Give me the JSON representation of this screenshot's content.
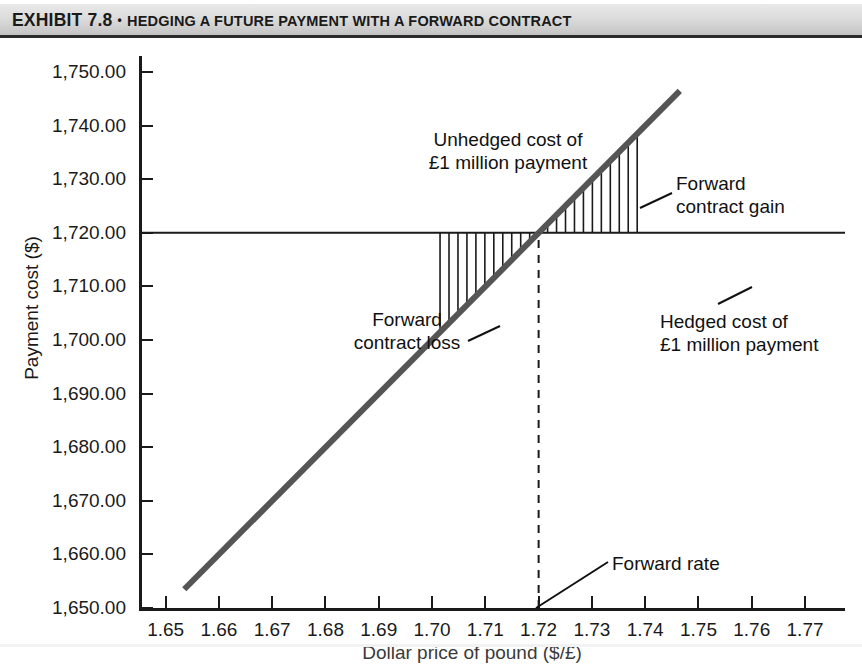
{
  "exhibit": {
    "number_label": "EXHIBIT 7.8",
    "bullet": "•",
    "title": "HEDGING A FUTURE PAYMENT WITH A FORWARD CONTRACT"
  },
  "chart_data": {
    "type": "line",
    "title": "Hedging a Future Payment with a Forward Contract",
    "xlabel": "Dollar price of pound ($/£)",
    "ylabel": "Payment cost ($)",
    "xlim": [
      1.645,
      1.7775
    ],
    "ylim": [
      1650.0,
      1753.0
    ],
    "grid": false,
    "legend": "none",
    "xticks": [
      "1.65",
      "1.66",
      "1.67",
      "1.68",
      "1.69",
      "1.70",
      "1.71",
      "1.72",
      "1.73",
      "1.74",
      "1.75",
      "1.76",
      "1.77"
    ],
    "xtick_values": [
      1.65,
      1.66,
      1.67,
      1.68,
      1.69,
      1.7,
      1.71,
      1.72,
      1.73,
      1.74,
      1.75,
      1.76,
      1.77
    ],
    "yticks": [
      "1,650.00",
      "1,660.00",
      "1,670.00",
      "1,680.00",
      "1,690.00",
      "1,700.00",
      "1,710.00",
      "1,720.00",
      "1,730.00",
      "1,740.00",
      "1,750.00"
    ],
    "ytick_values": [
      1650,
      1660,
      1670,
      1680,
      1690,
      1700,
      1710,
      1720,
      1730,
      1740,
      1750
    ],
    "series": [
      {
        "name": "Unhedged cost of £1 million payment",
        "style": "solid-thick",
        "color": "#555555",
        "x": [
          1.6535,
          1.7465
        ],
        "y": [
          1653.5,
          1746.5
        ],
        "slope": 1000,
        "note": "cost = 1,000,000 × spot rate"
      },
      {
        "name": "Hedged cost of £1 million payment",
        "style": "solid-thin-horizontal",
        "color": "#1a1a1a",
        "x": [
          1.645,
          1.7775
        ],
        "y": [
          1720.0,
          1720.0
        ],
        "constant_value": 1720.0
      },
      {
        "name": "Forward rate",
        "style": "dashed-vertical",
        "color": "#1a1a1a",
        "x_value": 1.72,
        "y_range": [
          1650.0,
          1720.0
        ]
      }
    ],
    "shaded_regions": [
      {
        "name": "Forward contract loss",
        "hatch": "vertical-lines",
        "x_range": [
          1.7015,
          1.72
        ],
        "y_upper": 1720.0,
        "y_lower_is_line": true
      },
      {
        "name": "Forward contract gain",
        "hatch": "vertical-lines",
        "x_range": [
          1.72,
          1.7385
        ],
        "y_lower": 1720.0,
        "y_upper_is_line": true
      }
    ],
    "annotations": [
      {
        "id": "unhedged",
        "lines": [
          "Unhedged cost of",
          "£1 million payment"
        ],
        "x": 1.705,
        "y": 1737
      },
      {
        "id": "gain",
        "lines": [
          "Forward",
          "contract gain"
        ],
        "x": 1.748,
        "y": 1729
      },
      {
        "id": "loss",
        "lines": [
          "Forward",
          "contract loss"
        ],
        "x": 1.69,
        "y": 1712
      },
      {
        "id": "hedged",
        "lines": [
          "Hedged cost of",
          "£1 million payment"
        ],
        "x": 1.745,
        "y": 1712
      },
      {
        "id": "forward-rate",
        "lines": [
          "Forward rate"
        ],
        "x": 1.735,
        "y": 1661
      }
    ]
  },
  "axes": {
    "y_title": "Payment cost ($)",
    "x_title": "Dollar price of pound ($/£)"
  },
  "annotations": {
    "unhedged_line1": "Unhedged cost of",
    "unhedged_line2": "£1 million payment",
    "gain_line1": "Forward",
    "gain_line2": "contract gain",
    "loss_line1": "Forward",
    "loss_line2": "contract loss",
    "hedged_line1": "Hedged cost of",
    "hedged_line2": "£1 million payment",
    "forward_rate": "Forward rate"
  },
  "colors": {
    "unhedged_line": "#555555",
    "axis": "#1a1a1a",
    "banner_dark": "#c3c3c3",
    "banner_light": "#e9e9e9"
  }
}
